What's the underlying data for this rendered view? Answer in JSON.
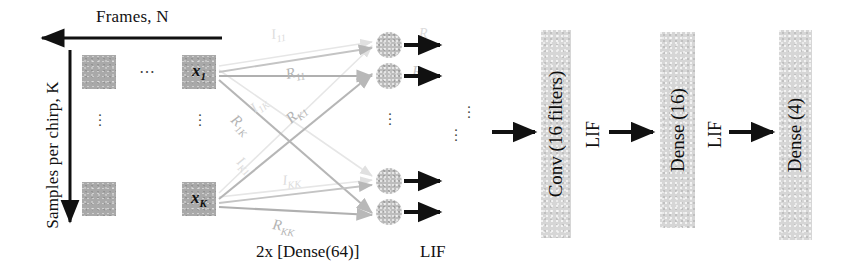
{
  "input_block": {
    "frames_axis_label": "Frames, N",
    "samples_axis_label": "Samples per chirp, K",
    "horizontal_ellipsis": "⋯",
    "vertical_ellipsis": "⋮",
    "cells": [
      {
        "label": "",
        "has_label": false
      },
      {
        "label": "x",
        "sub": "1",
        "has_label": true
      },
      {
        "label": "",
        "has_label": false
      },
      {
        "label": "x",
        "sub": "K",
        "has_label": true
      }
    ]
  },
  "recurrent_layer": {
    "caption": "2x [Dense(64)]",
    "activation": "LIF",
    "weight_labels": [
      {
        "name": "R",
        "sub": "11"
      },
      {
        "name": "R",
        "sub": "1K"
      },
      {
        "name": "R",
        "sub": "K1"
      },
      {
        "name": "R",
        "sub": "KK"
      }
    ],
    "faint_weight_labels": [
      {
        "name": "I",
        "sub": "11"
      },
      {
        "name": "I",
        "sub": "1K"
      },
      {
        "name": "I",
        "sub": "K1"
      },
      {
        "name": "I",
        "sub": "KK"
      }
    ],
    "output_label": "R",
    "neuron_count_visible": 4
  },
  "pipeline": {
    "blocks": [
      {
        "id": "conv",
        "label": "Conv (16 filters)"
      },
      {
        "id": "dense16",
        "label": "Dense (16)"
      },
      {
        "id": "dense4",
        "label": "Dense (4)"
      }
    ],
    "activations": [
      {
        "id": "lif-1",
        "label": "LIF"
      },
      {
        "id": "lif-2",
        "label": "LIF"
      }
    ]
  },
  "colors": {
    "input_cell": "#a9a9a9",
    "neuron": "#bdbdbd",
    "layer_block": "#d6d6d6",
    "arrow": "#111111",
    "weight_line": "#cfcfcf",
    "text": "#121212"
  }
}
